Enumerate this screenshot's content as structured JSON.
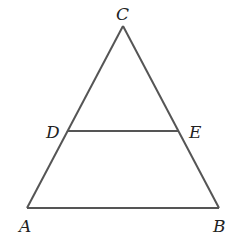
{
  "diagram": {
    "type": "geometry-triangle",
    "stroke_color": "#555555",
    "label_color": "#222222",
    "points": {
      "C": {
        "label": "C",
        "x": 123,
        "y": 26
      },
      "A": {
        "label": "A",
        "x": 27,
        "y": 208
      },
      "B": {
        "label": "B",
        "x": 219,
        "y": 208
      },
      "D": {
        "label": "D",
        "x": 68,
        "y": 131
      },
      "E": {
        "label": "E",
        "x": 179,
        "y": 131
      }
    },
    "segments": [
      "CA",
      "CB",
      "AB",
      "DE"
    ]
  }
}
